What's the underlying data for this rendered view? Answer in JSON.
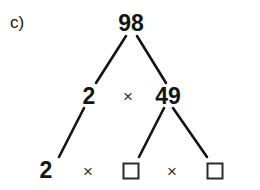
{
  "worksheet": {
    "part_label": "c)",
    "background_color": "#ffffff",
    "ink_color": "#141414",
    "operator_color": "#333333",
    "box_border_color": "#2b2b2b"
  },
  "diagram": {
    "type": "factor-tree",
    "root_value": "98",
    "levels": [
      {
        "level": 1,
        "nodes": [
          {
            "id": "root",
            "label": "98",
            "x": 131,
            "y": 23,
            "kind": "number"
          }
        ],
        "operators": []
      },
      {
        "level": 2,
        "nodes": [
          {
            "id": "mid-left",
            "label": "2",
            "x": 89,
            "y": 96,
            "kind": "number"
          },
          {
            "id": "mid-right",
            "label": "49",
            "x": 168,
            "y": 96,
            "kind": "number"
          }
        ],
        "operators": [
          {
            "id": "op-mid",
            "label": "×",
            "x": 128,
            "y": 96
          }
        ]
      },
      {
        "level": 3,
        "nodes": [
          {
            "id": "leaf-1",
            "label": "2",
            "x": 46,
            "y": 170,
            "kind": "number"
          },
          {
            "id": "leaf-2",
            "label": "",
            "x": 131,
            "y": 171,
            "kind": "answer-box"
          },
          {
            "id": "leaf-3",
            "label": "",
            "x": 215,
            "y": 171,
            "kind": "answer-box"
          }
        ],
        "operators": [
          {
            "id": "op-bottom-1",
            "label": "×",
            "x": 88,
            "y": 171
          },
          {
            "id": "op-bottom-2",
            "label": "×",
            "x": 172,
            "y": 171
          }
        ]
      }
    ],
    "branches": [
      {
        "id": "branch-root-left",
        "from": "root",
        "to": "mid-left",
        "x1": 126,
        "y1": 36,
        "x2": 96,
        "y2": 83
      },
      {
        "id": "branch-root-right",
        "from": "root",
        "to": "mid-right",
        "x1": 137,
        "y1": 36,
        "x2": 166,
        "y2": 83
      },
      {
        "id": "branch-mid-left-down",
        "from": "mid-left",
        "to": "leaf-1",
        "x1": 84,
        "y1": 108,
        "x2": 59,
        "y2": 157
      },
      {
        "id": "branch-49-left",
        "from": "mid-right",
        "to": "leaf-2",
        "x1": 164,
        "y1": 108,
        "x2": 139,
        "y2": 157
      },
      {
        "id": "branch-49-right",
        "from": "mid-right",
        "to": "leaf-3",
        "x1": 173,
        "y1": 108,
        "x2": 207,
        "y2": 157
      }
    ],
    "stroke_width": 2.6
  }
}
